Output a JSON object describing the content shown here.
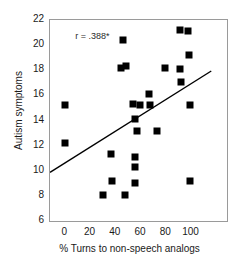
{
  "chart_data": {
    "type": "scatter",
    "title": "",
    "xlabel": "% Turns to non-speech analogs",
    "ylabel": "Autism symptoms",
    "xlim": [
      -12,
      128
    ],
    "ylim": [
      6,
      22
    ],
    "xticks": [
      0,
      20,
      40,
      60,
      80,
      100
    ],
    "yticks": [
      6,
      8,
      10,
      12,
      14,
      16,
      18,
      20,
      22
    ],
    "xtick_labels": [
      "0",
      "20",
      "40",
      "60",
      "80",
      "100"
    ],
    "ytick_labels": [
      "6",
      "8",
      "10",
      "12",
      "14",
      "16",
      "18",
      "20",
      "22"
    ],
    "grid": false,
    "legend": null,
    "annotations": [
      {
        "text": "r = .388*",
        "x": 8,
        "y": 20.7
      }
    ],
    "marker": {
      "shape": "square",
      "color": "#000000",
      "size": 7
    },
    "points": [
      {
        "x": 0,
        "y": 15.2
      },
      {
        "x": 0,
        "y": 12.2
      },
      {
        "x": 30,
        "y": 8.1
      },
      {
        "x": 36,
        "y": 11.3
      },
      {
        "x": 37,
        "y": 9.2
      },
      {
        "x": 44,
        "y": 18.2
      },
      {
        "x": 46,
        "y": 20.4
      },
      {
        "x": 47,
        "y": 8.1
      },
      {
        "x": 48,
        "y": 18.3
      },
      {
        "x": 54,
        "y": 15.3
      },
      {
        "x": 55,
        "y": 14.1
      },
      {
        "x": 55,
        "y": 11.1
      },
      {
        "x": 55,
        "y": 10.3
      },
      {
        "x": 55,
        "y": 9.0
      },
      {
        "x": 57,
        "y": 13.2
      },
      {
        "x": 59,
        "y": 15.2
      },
      {
        "x": 66,
        "y": 16.1
      },
      {
        "x": 67,
        "y": 15.2
      },
      {
        "x": 73,
        "y": 13.2
      },
      {
        "x": 79,
        "y": 18.2
      },
      {
        "x": 91,
        "y": 21.2
      },
      {
        "x": 91,
        "y": 18.1
      },
      {
        "x": 92,
        "y": 17.1
      },
      {
        "x": 97,
        "y": 21.1
      },
      {
        "x": 98,
        "y": 19.2
      },
      {
        "x": 99,
        "y": 15.2
      },
      {
        "x": 99,
        "y": 9.2
      }
    ],
    "trendline": {
      "type": "linear",
      "x_start": -12,
      "y_start": 9.75,
      "x_end": 117,
      "y_end": 17.9
    }
  }
}
